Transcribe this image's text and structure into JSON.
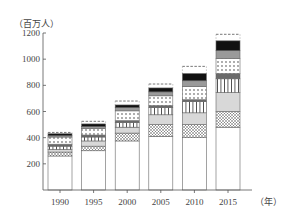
{
  "chart_data": {
    "type": "bar",
    "stacked": true,
    "title": "",
    "ylabel": "（百万人）",
    "xlabel": "（年）",
    "ylim": [
      0,
      1200
    ],
    "yticks": [
      200,
      400,
      600,
      800,
      1000,
      1200
    ],
    "categories": [
      "1990",
      "1995",
      "2000",
      "2005",
      "2010",
      "2015"
    ],
    "grid": false,
    "legend": "none",
    "series": [
      {
        "name": "segment-1 (white)",
        "pattern": "white",
        "values": [
          260,
          300,
          375,
          410,
          400,
          480
        ]
      },
      {
        "name": "segment-2 (crosshatch)",
        "pattern": "crosshatch",
        "values": [
          30,
          35,
          60,
          90,
          100,
          120
        ]
      },
      {
        "name": "segment-3 (light gray)",
        "pattern": "lightgray",
        "values": [
          20,
          40,
          45,
          75,
          90,
          145
        ]
      },
      {
        "name": "segment-4 (vertical stripes)",
        "pattern": "vstripes",
        "values": [
          25,
          30,
          35,
          55,
          85,
          105
        ]
      },
      {
        "name": "segment-5 (dark gray band)",
        "pattern": "darkgray",
        "values": [
          15,
          15,
          15,
          15,
          15,
          40
        ]
      },
      {
        "name": "segment-6 (dots)",
        "pattern": "dots",
        "values": [
          55,
          50,
          75,
          75,
          100,
          115
        ]
      },
      {
        "name": "segment-7 (medium gray)",
        "pattern": "midgray",
        "values": [
          10,
          15,
          25,
          30,
          45,
          60
        ]
      },
      {
        "name": "segment-8 (black)",
        "pattern": "black",
        "values": [
          15,
          20,
          20,
          30,
          55,
          75
        ]
      },
      {
        "name": "segment-9 (dashed outline)",
        "pattern": "dashed",
        "values": [
          10,
          20,
          30,
          30,
          55,
          50
        ]
      }
    ],
    "totals": [
      440,
      525,
      675,
      810,
      945,
      1190
    ]
  },
  "axis": {
    "y_unit": "（百万人）",
    "x_unit": "（年）",
    "y_tick_labels": [
      "200",
      "400",
      "600",
      "800",
      "1000",
      "1200"
    ],
    "x_tick_labels": [
      "1990",
      "1995",
      "2000",
      "2005",
      "2010",
      "2015"
    ]
  },
  "colors": {
    "axis": "#555555",
    "bar_outline": "#666666",
    "lightgray": "#d8d8d8",
    "midgray": "#9a9a9a",
    "darkgray": "#6a6a6a",
    "black": "#111111"
  }
}
